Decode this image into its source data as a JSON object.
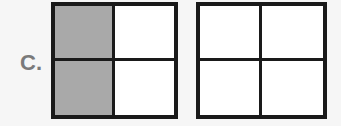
{
  "label": "C.",
  "colors": {
    "shaded": "#a9a9a9",
    "unshaded": "#ffffff",
    "border": "#1a1a1a",
    "label": "#7a7a7a"
  },
  "squares": [
    {
      "name": "left-square",
      "grid": "2x2",
      "cells": [
        {
          "position": "top-left",
          "shaded": true
        },
        {
          "position": "top-right",
          "shaded": false
        },
        {
          "position": "bottom-left",
          "shaded": true
        },
        {
          "position": "bottom-right",
          "shaded": false
        }
      ]
    },
    {
      "name": "right-square",
      "grid": "2x2",
      "cells": [
        {
          "position": "top-left",
          "shaded": false
        },
        {
          "position": "top-right",
          "shaded": false
        },
        {
          "position": "bottom-left",
          "shaded": false
        },
        {
          "position": "bottom-right",
          "shaded": false
        }
      ]
    }
  ]
}
